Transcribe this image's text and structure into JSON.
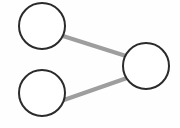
{
  "diagram": {
    "type": "graph",
    "canvas": {
      "width": 180,
      "height": 128,
      "background": "#fefefe"
    },
    "style": {
      "node_fill": "#ffffff",
      "node_stroke": "#2b2b2b",
      "node_stroke_width": 2,
      "edge_color": "#9e9e9e",
      "edge_width": 4
    },
    "nodes": [
      {
        "id": "n1",
        "label": "",
        "cx": 42,
        "cy": 26,
        "r": 23
      },
      {
        "id": "n2",
        "label": "",
        "cx": 42,
        "cy": 93,
        "r": 23
      },
      {
        "id": "n3",
        "label": "",
        "cx": 146,
        "cy": 66,
        "r": 23
      }
    ],
    "edges": [
      {
        "id": "e1",
        "from": "n1",
        "to": "n3",
        "x1": 63,
        "y1": 36,
        "x2": 126,
        "y2": 56
      },
      {
        "id": "e2",
        "from": "n2",
        "to": "n3",
        "x1": 61,
        "y1": 101,
        "x2": 127,
        "y2": 78
      }
    ]
  }
}
